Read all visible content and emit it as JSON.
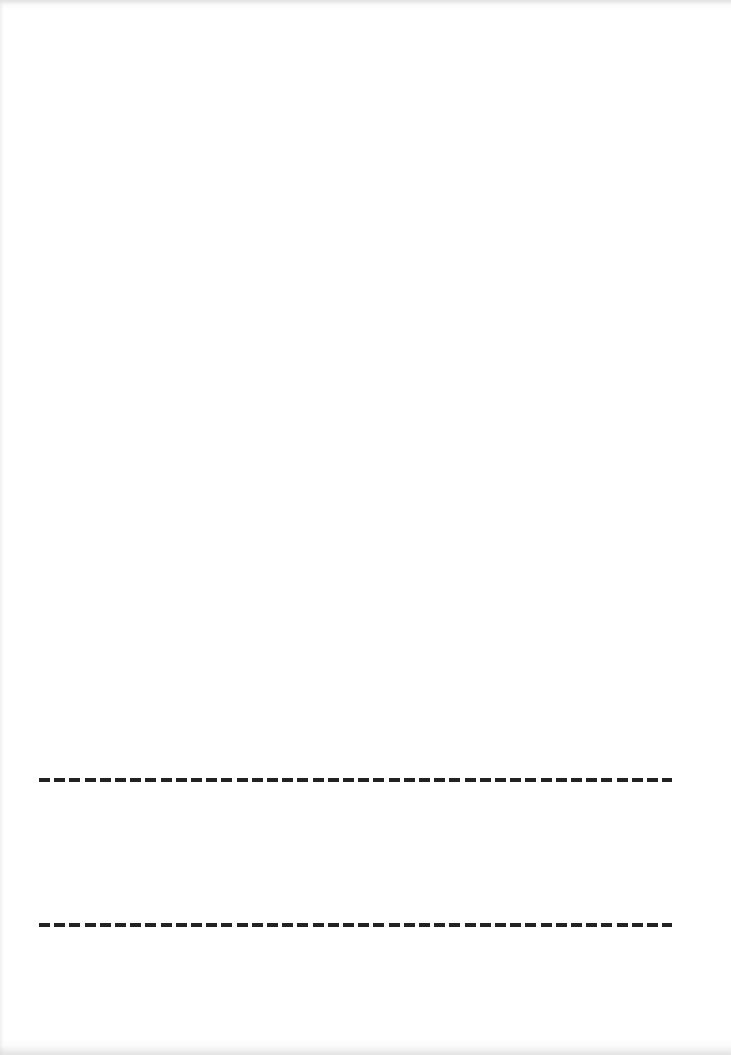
{
  "page": {
    "background_color": "#ffffff",
    "width": 731,
    "height": 1055
  },
  "lines": [
    {
      "name": "dashed-line-1",
      "style": "dashed",
      "color": "#222222",
      "x_start": 39,
      "x_end": 672,
      "y": 780,
      "thickness": 4
    },
    {
      "name": "dashed-line-2",
      "style": "dashed",
      "color": "#222222",
      "x_start": 39,
      "x_end": 672,
      "y": 925,
      "thickness": 4
    }
  ]
}
